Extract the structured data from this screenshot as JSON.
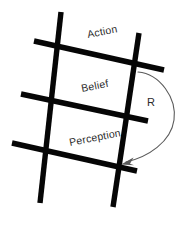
{
  "diagram": {
    "background_color": "#ffffff",
    "bar_color": "#060606",
    "label_color": "#2b2b2b",
    "arrow_color": "#5a5a5a",
    "layers": [
      {
        "id": "action",
        "label": "Action",
        "x": 88,
        "y": 38,
        "rotation": -11
      },
      {
        "id": "belief",
        "label": "Belief",
        "x": 82,
        "y": 92,
        "rotation": -11
      },
      {
        "id": "perception",
        "label": "Perception",
        "x": 70,
        "y": 146,
        "rotation": -11
      }
    ],
    "edges": [
      {
        "id": "feedback-r",
        "label": "R",
        "label_x": 147,
        "label_y": 106,
        "from_layer": "action",
        "to_layer": "perception",
        "path": "M138,72 C160,74 177,98 174,120 C171,142 148,157 126,162",
        "arrow_tip_x": 122,
        "arrow_tip_y": 163
      }
    ],
    "verticals": [
      {
        "id": "vertical-left",
        "x1": 61,
        "y1": 12,
        "x2": 40,
        "y2": 203,
        "width": 5.4
      },
      {
        "id": "vertical-right",
        "x1": 139,
        "y1": 33,
        "x2": 113,
        "y2": 207,
        "width": 5.4
      }
    ],
    "horizontals": [
      {
        "id": "rung-top",
        "x1": 34,
        "y1": 41,
        "x2": 164,
        "y2": 70,
        "width": 5.4
      },
      {
        "id": "rung-middle",
        "x1": 21,
        "y1": 94,
        "x2": 148,
        "y2": 121,
        "width": 5.4
      },
      {
        "id": "rung-bottom",
        "x1": 12,
        "y1": 143,
        "x2": 137,
        "y2": 171,
        "width": 5.4
      }
    ]
  }
}
